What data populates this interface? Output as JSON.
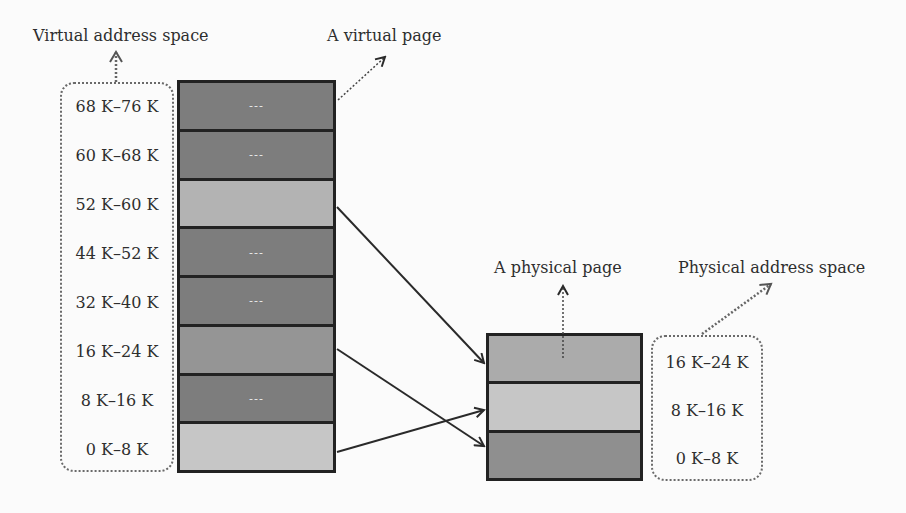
{
  "labels": {
    "virtual_space": "Virtual address space",
    "virtual_page": "A virtual page",
    "physical_page": "A physical page",
    "physical_space": "Physical address space"
  },
  "virtual_pages": [
    {
      "range": "68 K–76 K",
      "content": "---",
      "color": "#7d7d7d"
    },
    {
      "range": "60 K–68 K",
      "content": "---",
      "color": "#7d7d7d"
    },
    {
      "range": "52 K–60 K",
      "content": "",
      "color": "#b3b3b3"
    },
    {
      "range": "44 K–52 K",
      "content": "---",
      "color": "#7d7d7d"
    },
    {
      "range": "32 K–40 K",
      "content": "---",
      "color": "#7d7d7d"
    },
    {
      "range": "16 K–24 K",
      "content": "",
      "color": "#959595"
    },
    {
      "range": "8 K–16 K",
      "content": "---",
      "color": "#7d7d7d"
    },
    {
      "range": "0 K–8 K",
      "content": "",
      "color": "#c6c6c6"
    }
  ],
  "physical_pages": [
    {
      "range": "16 K–24 K",
      "color": "#ababab"
    },
    {
      "range": "8 K–16 K",
      "color": "#c6c6c6"
    },
    {
      "range": "0 K–8 K",
      "color": "#8f8f8f"
    }
  ],
  "mappings": [
    {
      "from": "52 K–60 K",
      "to": "16 K–24 K"
    },
    {
      "from": "16 K–24 K",
      "to": "0 K–8 K"
    },
    {
      "from": "0 K–8 K",
      "to": "8 K–16 K"
    }
  ]
}
